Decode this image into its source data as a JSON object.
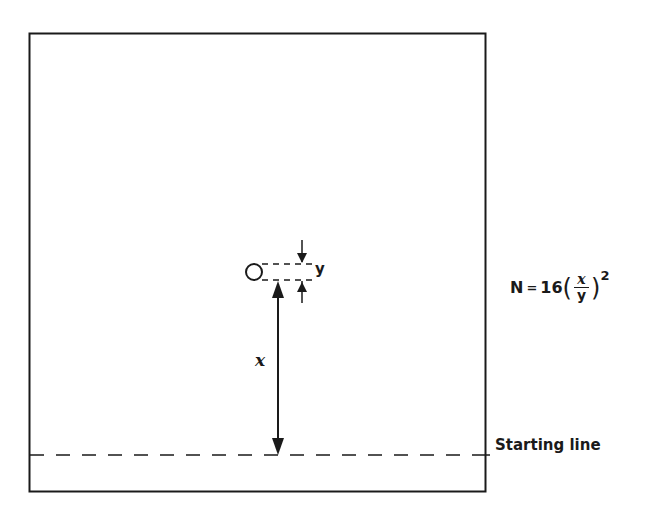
{
  "diagram": {
    "labels": {
      "y": "y",
      "x": "x",
      "starting_line": "Starting line"
    },
    "formula": {
      "lhs": "N",
      "eq": "=",
      "coef": "16",
      "numerator": "x",
      "denominator": "y",
      "open_paren": "(",
      "close_paren": ")",
      "exponent": "2"
    },
    "colors": {
      "line": "#1a1a1a",
      "background": "#ffffff"
    }
  }
}
